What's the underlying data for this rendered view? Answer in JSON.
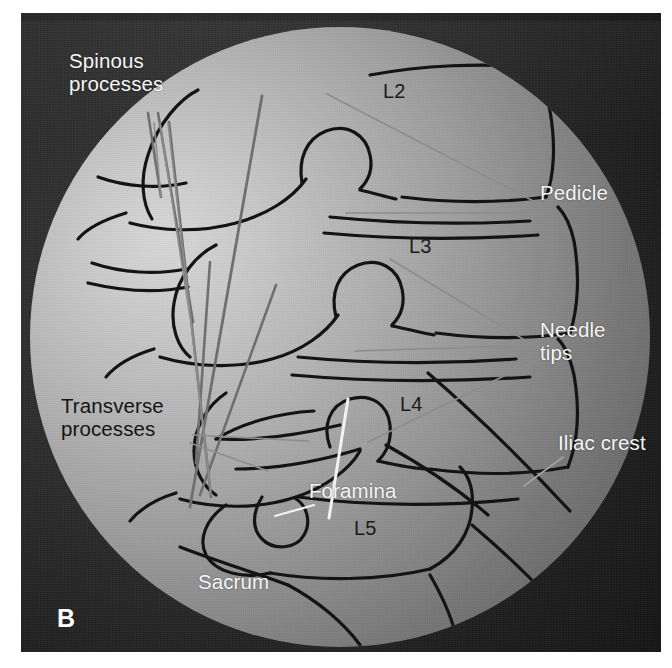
{
  "figure": {
    "panel_letter": "B",
    "modality": "fluoroscopy-line-drawing-overlay",
    "colors": {
      "plate_dark": "#222222",
      "field_light": "#d8d8d8",
      "field_shadow": "#565656",
      "outline": "#141414",
      "needle": "#6e6e6e",
      "white_text": "#f6f6f6",
      "black_text": "#141414"
    }
  },
  "labels": [
    {
      "id": "spinous-processes",
      "text": "Spinous\nprocesses",
      "color": "white",
      "x": 48,
      "y": 36
    },
    {
      "id": "transverse-processes",
      "text": "Transverse\nprocesses",
      "color": "black",
      "x": 40,
      "y": 381
    },
    {
      "id": "pedicle",
      "text": "Pedicle",
      "color": "white",
      "x": 519,
      "y": 168
    },
    {
      "id": "needle-tips",
      "text": "Needle\ntips",
      "color": "white",
      "x": 519,
      "y": 305
    },
    {
      "id": "iliac-crest",
      "text": "Iliac crest",
      "color": "white",
      "x": 537,
      "y": 418
    },
    {
      "id": "foramina",
      "text": "Foramina",
      "color": "white",
      "x": 288,
      "y": 466
    },
    {
      "id": "sacrum",
      "text": "Sacrum",
      "color": "white",
      "x": 177,
      "y": 557
    }
  ],
  "vertebral_levels": [
    {
      "id": "L2",
      "text": "L2",
      "x": 362,
      "y": 67
    },
    {
      "id": "L3",
      "text": "L3",
      "x": 388,
      "y": 222
    },
    {
      "id": "L4",
      "text": "L4",
      "x": 379,
      "y": 380
    },
    {
      "id": "L5",
      "text": "L5",
      "x": 333,
      "y": 504
    }
  ],
  "leader_lines": [
    {
      "id": "spinous-leader-1",
      "from": [
        124,
        96
      ],
      "to": [
        131,
        170
      ],
      "color": "#8d8d8d"
    },
    {
      "id": "spinous-leader-2",
      "from": [
        130,
        96
      ],
      "to": [
        160,
        290
      ],
      "color": "#8d8d8d"
    },
    {
      "id": "spinous-leader-3",
      "from": [
        138,
        96
      ],
      "to": [
        181,
        468
      ],
      "color": "#8d8d8d"
    },
    {
      "id": "pedicle-leader-1",
      "from": [
        513,
        179
      ],
      "to": [
        297,
        67
      ],
      "color": "#8d8d8d"
    },
    {
      "id": "pedicle-leader-2",
      "from": [
        513,
        186
      ],
      "to": [
        316,
        186
      ],
      "color": "#8d8d8d"
    },
    {
      "id": "needletips-leader-1",
      "from": [
        513,
        318
      ],
      "to": [
        325,
        324
      ],
      "color": "#8d8d8d"
    },
    {
      "id": "needletips-leader-2",
      "from": [
        513,
        324
      ],
      "to": [
        360,
        232
      ],
      "color": "#8d8d8d"
    },
    {
      "id": "needletips-leader-3",
      "from": [
        513,
        330
      ],
      "to": [
        338,
        415
      ],
      "color": "#8d8d8d"
    },
    {
      "id": "iliac-leader",
      "from": [
        533,
        430
      ],
      "to": [
        494,
        459
      ],
      "color": "#9a9a9a"
    },
    {
      "id": "foramina-leader",
      "from": [
        284,
        478
      ],
      "to": [
        245,
        489
      ],
      "color": "#f2f2f2"
    },
    {
      "id": "transverse-leader-1",
      "from": [
        163,
        408
      ],
      "to": [
        272,
        414
      ],
      "color": "#8d8d8d"
    },
    {
      "id": "transverse-leader-2",
      "from": [
        163,
        414
      ],
      "to": [
        232,
        440
      ],
      "color": "#8d8d8d"
    }
  ],
  "needles": [
    {
      "id": "needle-1",
      "from": [
        118,
        86
      ],
      "to": [
        131,
        170
      ],
      "tip_white": false
    },
    {
      "id": "needle-2",
      "from": [
        128,
        86
      ],
      "to": [
        163,
        295
      ],
      "tip_white": false
    },
    {
      "id": "needle-3",
      "from": [
        139,
        95
      ],
      "to": [
        181,
        470
      ],
      "tip_white": false
    },
    {
      "id": "needle-4",
      "from": [
        180,
        235
      ],
      "to": [
        166,
        436
      ],
      "tip_white": false
    },
    {
      "id": "needle-5",
      "from": [
        232,
        69
      ],
      "to": [
        160,
        480
      ],
      "tip_white": false
    },
    {
      "id": "needle-6",
      "from": [
        246,
        258
      ],
      "to": [
        170,
        468
      ],
      "tip_white": false
    },
    {
      "id": "needle-7",
      "from": [
        318,
        372
      ],
      "to": [
        299,
        491
      ],
      "tip_white": true
    }
  ],
  "interaction": {
    "hint": "static figure — labels and leader lines only"
  }
}
